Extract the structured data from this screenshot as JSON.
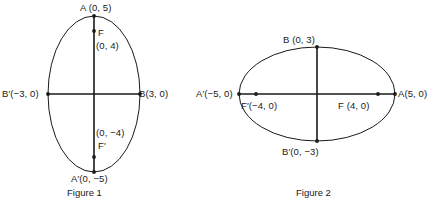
{
  "document": {
    "kind": "geometry-figure-pair",
    "background_color": "#ffffff",
    "stroke_color": "#1a1a1a"
  },
  "figures": [
    {
      "id": "figure-1",
      "caption": "Figure 1",
      "orientation": "vertical-major-axis",
      "center": [
        94,
        94
      ],
      "radius_x_px": 46,
      "radius_y_px": 78,
      "labels": {
        "vertex_top": "A (0, 5)",
        "focus_top_name": "F",
        "focus_top_value": "(0, 4)",
        "covertex_left": "B′(−3, 0)",
        "covertex_right": "B(3, 0)",
        "focus_bottom_value": "(0, −4)",
        "focus_bottom_name": "F′",
        "vertex_bottom": "A′(0, −5)"
      },
      "points": [
        {
          "name": "A",
          "coords": "(0, 5)"
        },
        {
          "name": "F",
          "coords": "(0, 4)"
        },
        {
          "name": "B′",
          "coords": "(−3, 0)"
        },
        {
          "name": "B",
          "coords": "(3, 0)"
        },
        {
          "name": "F′",
          "coords": "(0, −4)"
        },
        {
          "name": "A′",
          "coords": "(0, −5)"
        }
      ]
    },
    {
      "id": "figure-2",
      "caption": "Figure 2",
      "orientation": "horizontal-major-axis",
      "center": [
        317,
        94
      ],
      "radius_x_px": 78,
      "radius_y_px": 47,
      "labels": {
        "covertex_top": "B (0, 3)",
        "vertex_left": "A′(−5, 0)",
        "focus_left": "F′(−4, 0)",
        "focus_right": "F (4, 0)",
        "vertex_right": "A(5, 0)",
        "covertex_bottom": "B′(0, −3)"
      },
      "points": [
        {
          "name": "B",
          "coords": "(0, 3)"
        },
        {
          "name": "A′",
          "coords": "(−5, 0)"
        },
        {
          "name": "F′",
          "coords": "(−4, 0)"
        },
        {
          "name": "F",
          "coords": "(4, 0)"
        },
        {
          "name": "A",
          "coords": "(5, 0)"
        },
        {
          "name": "B′",
          "coords": "(0, −3)"
        }
      ]
    }
  ]
}
